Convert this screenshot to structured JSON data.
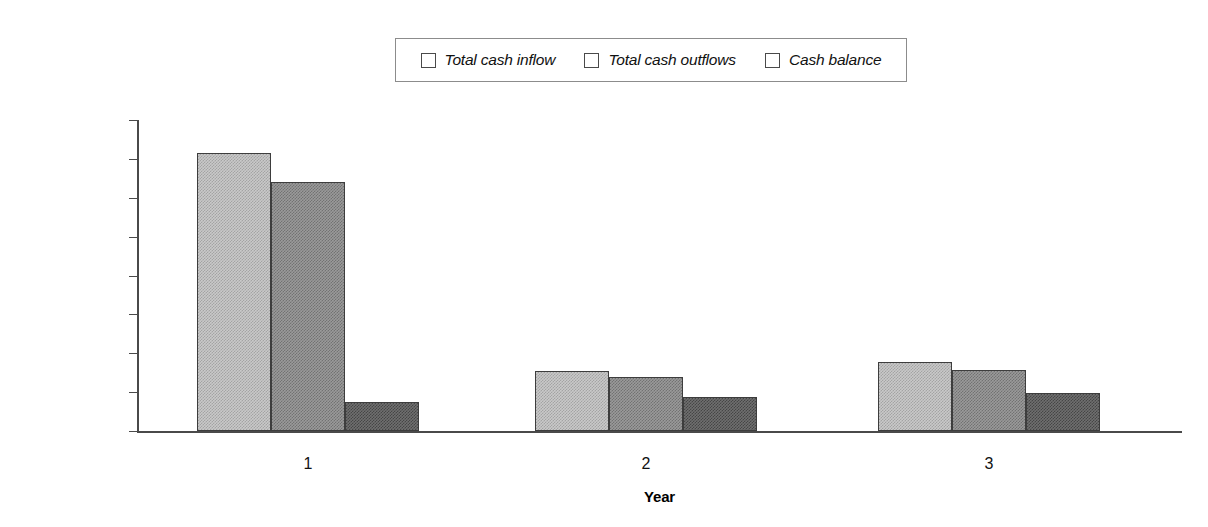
{
  "chart_data": {
    "type": "bar",
    "title": "",
    "xlabel": "Year",
    "ylabel": "",
    "categories": [
      "1",
      "2",
      "3"
    ],
    "series": [
      {
        "name": "Total cash inflow",
        "values": [
          715000,
          154000,
          177000
        ],
        "color": "#c9c9c9"
      },
      {
        "name": "Total cash outflows",
        "values": [
          640000,
          140000,
          158000
        ],
        "color": "#9a9a9a"
      },
      {
        "name": "Cash balance",
        "values": [
          75000,
          88000,
          99000
        ],
        "color": "#6f6f6f"
      }
    ],
    "ylim": [
      0,
      800000
    ],
    "ytick_values": [
      0,
      100000,
      200000,
      300000,
      400000,
      500000,
      600000,
      700000,
      800000
    ],
    "ytick_labels": [
      "$0",
      "$100,000",
      "$200,000",
      "$300,000",
      "$400,000",
      "$500,000",
      "$600,000",
      "$700,000",
      "$800,000"
    ],
    "grid": false,
    "legend_position": "top"
  },
  "legend": {
    "entries": [
      {
        "label": "Total cash inflow"
      },
      {
        "label": "Total cash outflows"
      },
      {
        "label": "Cash balance"
      }
    ]
  },
  "axes": {
    "x_title": "Year"
  }
}
